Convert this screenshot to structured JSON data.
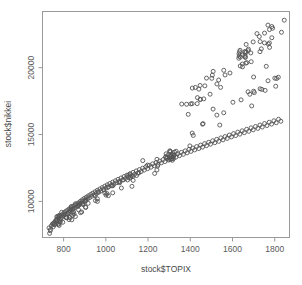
{
  "chart_data": {
    "type": "scatter",
    "title": "",
    "xlabel": "stock$TOPIX",
    "ylabel": "stock$nikkei",
    "xlim": [
      700,
      1870
    ],
    "ylim": [
      7300,
      24200
    ],
    "xticks": [
      800,
      1000,
      1200,
      1400,
      1600,
      1800
    ],
    "yticks": [
      10000,
      15000,
      20000
    ],
    "xticklabels": [
      "800",
      "1000",
      "1200",
      "1400",
      "1600",
      "1800"
    ],
    "yticklabels": [
      "10000",
      "15000",
      "20000"
    ],
    "grid": false,
    "legend": null,
    "marker": "open-circle",
    "marker_size": 4,
    "marker_color": "#555555",
    "n_points": 214,
    "series": [
      {
        "name": "nikkei vs TOPIX",
        "points": [
          [
            731,
            8020
          ],
          [
            738,
            7900
          ],
          [
            742,
            8180
          ],
          [
            747,
            8300
          ],
          [
            751,
            8100
          ],
          [
            755,
            8420
          ],
          [
            758,
            8250
          ],
          [
            762,
            8560
          ],
          [
            765,
            8360
          ],
          [
            769,
            8640
          ],
          [
            772,
            8480
          ],
          [
            776,
            8760
          ],
          [
            779,
            8600
          ],
          [
            783,
            8880
          ],
          [
            786,
            8700
          ],
          [
            790,
            8980
          ],
          [
            793,
            8820
          ],
          [
            797,
            9060
          ],
          [
            801,
            8930
          ],
          [
            804,
            9180
          ],
          [
            808,
            9020
          ],
          [
            812,
            9280
          ],
          [
            816,
            9120
          ],
          [
            820,
            9360
          ],
          [
            824,
            9200
          ],
          [
            828,
            9460
          ],
          [
            832,
            9300
          ],
          [
            836,
            9540
          ],
          [
            840,
            9400
          ],
          [
            845,
            9640
          ],
          [
            849,
            9480
          ],
          [
            853,
            9720
          ],
          [
            858,
            9580
          ],
          [
            862,
            9820
          ],
          [
            866,
            9680
          ],
          [
            871,
            9900
          ],
          [
            875,
            9760
          ],
          [
            880,
            10010
          ],
          [
            884,
            9860
          ],
          [
            889,
            10120
          ],
          [
            893,
            9980
          ],
          [
            898,
            10220
          ],
          [
            903,
            10080
          ],
          [
            908,
            10320
          ],
          [
            913,
            10180
          ],
          [
            918,
            10420
          ],
          [
            923,
            10280
          ],
          [
            928,
            10520
          ],
          [
            933,
            10380
          ],
          [
            938,
            10620
          ],
          [
            944,
            10480
          ],
          [
            949,
            10720
          ],
          [
            955,
            10580
          ],
          [
            960,
            10830
          ],
          [
            966,
            10680
          ],
          [
            972,
            10930
          ],
          [
            977,
            10780
          ],
          [
            983,
            11030
          ],
          [
            989,
            10880
          ],
          [
            995,
            11140
          ],
          [
            1001,
            10990
          ],
          [
            1007,
            11240
          ],
          [
            1013,
            11090
          ],
          [
            1019,
            11340
          ],
          [
            1026,
            11190
          ],
          [
            1032,
            11440
          ],
          [
            1039,
            11290
          ],
          [
            1045,
            11540
          ],
          [
            1052,
            11400
          ],
          [
            1058,
            11650
          ],
          [
            1065,
            11500
          ],
          [
            1072,
            11750
          ],
          [
            1079,
            11600
          ],
          [
            1086,
            11860
          ],
          [
            1093,
            11710
          ],
          [
            1100,
            11960
          ],
          [
            1107,
            11810
          ],
          [
            1114,
            12060
          ],
          [
            1121,
            11920
          ],
          [
            1129,
            12170
          ],
          [
            1136,
            12020
          ],
          [
            1144,
            12280
          ],
          [
            1151,
            12120
          ],
          [
            1159,
            12380
          ],
          [
            1167,
            12230
          ],
          [
            1174,
            12480
          ],
          [
            1182,
            12340
          ],
          [
            1190,
            12600
          ],
          [
            1198,
            12450
          ],
          [
            1206,
            12700
          ],
          [
            1214,
            12560
          ],
          [
            1222,
            12810
          ],
          [
            1230,
            12660
          ],
          [
            1238,
            12910
          ],
          [
            1247,
            12770
          ],
          [
            1255,
            13020
          ],
          [
            1263,
            12880
          ],
          [
            1272,
            13130
          ],
          [
            1280,
            12980
          ],
          [
            1289,
            13240
          ],
          [
            1297,
            13090
          ],
          [
            1306,
            13350
          ],
          [
            1314,
            13200
          ],
          [
            1323,
            13450
          ],
          [
            1332,
            13310
          ],
          [
            1340,
            13560
          ],
          [
            1349,
            13420
          ],
          [
            1358,
            13670
          ],
          [
            1367,
            13520
          ],
          [
            1376,
            13780
          ],
          [
            1385,
            13630
          ],
          [
            1394,
            13890
          ],
          [
            1403,
            13740
          ],
          [
            1412,
            13990
          ],
          [
            1421,
            13850
          ],
          [
            1430,
            14100
          ],
          [
            1440,
            13950
          ],
          [
            1449,
            14210
          ],
          [
            1458,
            14060
          ],
          [
            1468,
            14320
          ],
          [
            1477,
            14170
          ],
          [
            1487,
            14420
          ],
          [
            1496,
            14280
          ],
          [
            1506,
            14530
          ],
          [
            1516,
            14390
          ],
          [
            1525,
            14640
          ],
          [
            1535,
            14490
          ],
          [
            1545,
            14750
          ],
          [
            1555,
            14600
          ],
          [
            1565,
            14850
          ],
          [
            1575,
            14710
          ],
          [
            1585,
            14960
          ],
          [
            1595,
            14820
          ],
          [
            1605,
            15070
          ],
          [
            1615,
            14920
          ],
          [
            1625,
            15180
          ],
          [
            1635,
            15030
          ],
          [
            1646,
            15280
          ],
          [
            1656,
            15140
          ],
          [
            1667,
            15390
          ],
          [
            1677,
            15240
          ],
          [
            1688,
            15500
          ],
          [
            1698,
            15350
          ],
          [
            1709,
            15600
          ],
          [
            1720,
            15460
          ],
          [
            1730,
            15710
          ],
          [
            1741,
            15560
          ],
          [
            1752,
            15820
          ],
          [
            1763,
            15670
          ],
          [
            1774,
            15920
          ],
          [
            1785,
            15780
          ],
          [
            1796,
            16030
          ],
          [
            1807,
            15880
          ],
          [
            1818,
            16140
          ],
          [
            1829,
            15990
          ]
        ]
      }
    ]
  },
  "axes": {
    "x_title": "stock$TOPIX",
    "y_title": "stock$nikkei"
  }
}
